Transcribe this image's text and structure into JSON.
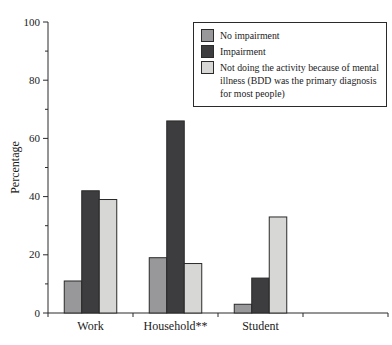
{
  "figure": {
    "background": "#ffffff",
    "text_color": "#1a1a1a",
    "axis_color": "#2a2a2a"
  },
  "chart_data": {
    "type": "bar",
    "title": "",
    "xlabel": "",
    "ylabel": "Percentage",
    "ylim": [
      0,
      100
    ],
    "y_major_ticks": [
      0,
      20,
      40,
      60,
      80,
      100
    ],
    "y_minor_tick_step": 10,
    "grid": false,
    "legend_position": "upper right",
    "bar_outline_color": "#2a2a2a",
    "categories": [
      "Work",
      "Household**",
      "Student"
    ],
    "series": [
      {
        "name": "No impairment",
        "color": "#98989a",
        "values": [
          11,
          19,
          3
        ]
      },
      {
        "name": "Impairment",
        "color": "#3d3d3f",
        "values": [
          42,
          66,
          12
        ]
      },
      {
        "name": "Not doing the activity because of mental illness (BDD was the primary diagnosis for most people)",
        "color": "#d7d7d5",
        "values": [
          39,
          17,
          33
        ]
      }
    ]
  }
}
